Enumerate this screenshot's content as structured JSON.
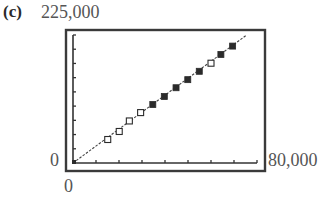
{
  "panel": {
    "label": "(c)"
  },
  "chart_data": {
    "type": "scatter",
    "title": "",
    "xlabel": "",
    "ylabel": "",
    "xlim": [
      0,
      80000
    ],
    "ylim": [
      0,
      225000
    ],
    "x_tick_labels": [
      "0",
      "80,000"
    ],
    "y_tick_labels": [
      "0",
      "225,000"
    ],
    "x_tick_step": 10000,
    "y_tick_step": 25000,
    "grid": false,
    "legend": null,
    "series": [
      {
        "name": "open-markers",
        "marker": "hollow-square",
        "points": [
          {
            "x": 15100,
            "y": 41300
          },
          {
            "x": 20100,
            "y": 55400
          },
          {
            "x": 24500,
            "y": 73900
          },
          {
            "x": 29400,
            "y": 88600
          },
          {
            "x": 60000,
            "y": 175400
          }
        ]
      },
      {
        "name": "filled-markers",
        "marker": "filled-square",
        "points": [
          {
            "x": 34700,
            "y": 102800
          },
          {
            "x": 39700,
            "y": 116900
          },
          {
            "x": 44800,
            "y": 132300
          },
          {
            "x": 49900,
            "y": 146500
          },
          {
            "x": 54900,
            "y": 161200
          },
          {
            "x": 64300,
            "y": 190800
          },
          {
            "x": 69400,
            "y": 205500
          }
        ]
      },
      {
        "name": "regression-line",
        "style": "dashed",
        "points": [
          {
            "x": 0,
            "y": 0
          },
          {
            "x": 75500,
            "y": 225000
          }
        ]
      }
    ]
  },
  "labels": {
    "y_top": "225,000",
    "y_zero": "0",
    "x_end": "80,000",
    "x_zero": "0"
  }
}
